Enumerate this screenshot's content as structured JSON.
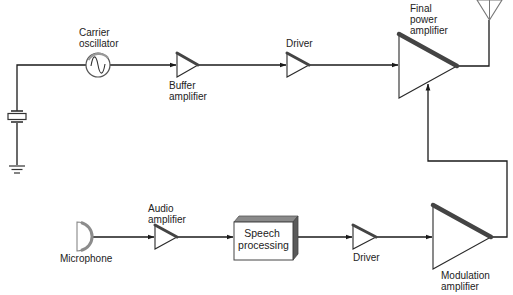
{
  "diagram": {
    "labels": {
      "carrier_oscillator": [
        "Carrier",
        "oscillator"
      ],
      "buffer_amplifier": [
        "Buffer",
        "amplifier"
      ],
      "driver_top": [
        "Driver"
      ],
      "final_power_amplifier": [
        "Final",
        "power",
        "amplifier"
      ],
      "microphone": [
        "Microphone"
      ],
      "audio_amplifier": [
        "Audio",
        "amplifier"
      ],
      "speech_processing": [
        "Speech",
        "processing"
      ],
      "driver_bottom": [
        "Driver"
      ],
      "modulation_amplifier": [
        "Modulation",
        "amplifier"
      ]
    },
    "components": [
      {
        "id": "crystal",
        "type": "crystal",
        "icon": "crystal-icon"
      },
      {
        "id": "ground",
        "type": "ground",
        "icon": "ground-icon"
      },
      {
        "id": "carrier_oscillator",
        "type": "oscillator",
        "icon": "sine-wave-icon"
      },
      {
        "id": "buffer_amplifier",
        "type": "amplifier",
        "icon": "triangle-amplifier-icon"
      },
      {
        "id": "driver_top",
        "type": "amplifier",
        "icon": "triangle-amplifier-icon"
      },
      {
        "id": "final_power_amplifier",
        "type": "amplifier",
        "icon": "triangle-amplifier-icon"
      },
      {
        "id": "antenna",
        "type": "antenna",
        "icon": "antenna-icon"
      },
      {
        "id": "microphone",
        "type": "microphone",
        "icon": "microphone-icon"
      },
      {
        "id": "audio_amplifier",
        "type": "amplifier",
        "icon": "triangle-amplifier-icon"
      },
      {
        "id": "speech_processing",
        "type": "block"
      },
      {
        "id": "driver_bottom",
        "type": "amplifier",
        "icon": "triangle-amplifier-icon"
      },
      {
        "id": "modulation_amplifier",
        "type": "amplifier",
        "icon": "triangle-amplifier-icon"
      }
    ],
    "connections": [
      [
        "crystal",
        "carrier_oscillator"
      ],
      [
        "carrier_oscillator",
        "buffer_amplifier"
      ],
      [
        "buffer_amplifier",
        "driver_top"
      ],
      [
        "driver_top",
        "final_power_amplifier"
      ],
      [
        "final_power_amplifier",
        "antenna"
      ],
      [
        "microphone",
        "audio_amplifier"
      ],
      [
        "audio_amplifier",
        "speech_processing"
      ],
      [
        "speech_processing",
        "driver_bottom"
      ],
      [
        "driver_bottom",
        "modulation_amplifier"
      ],
      [
        "modulation_amplifier",
        "final_power_amplifier"
      ]
    ],
    "colors": {
      "line": "#1a1a1a",
      "amp_bar": "#444444",
      "box_top_shade": "#8a8a8a",
      "box_side_shade": "#5a5a5a",
      "mic_shade": "#8c8c8c"
    }
  }
}
